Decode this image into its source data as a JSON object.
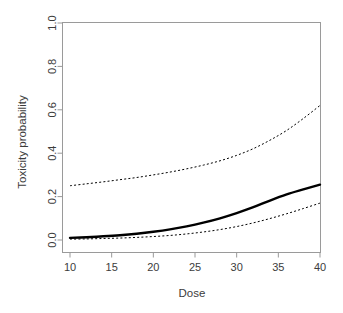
{
  "chart_data": {
    "type": "line",
    "title": "",
    "subtitle": "",
    "xlabel": "Dose",
    "ylabel": "Toxicity probability",
    "xlim": [
      10,
      40
    ],
    "ylim": [
      0.0,
      1.0
    ],
    "xticks": [
      10,
      15,
      20,
      25,
      30,
      35,
      40
    ],
    "xticklabels": [
      "10",
      "15",
      "20",
      "25",
      "30",
      "35",
      "40"
    ],
    "yticks": [
      0.0,
      0.2,
      0.4,
      0.6,
      0.8,
      1.0
    ],
    "yticklabels": [
      "0.0",
      "0.2",
      "0.4",
      "0.6",
      "0.8",
      "1.0"
    ],
    "grid": false,
    "legend": false,
    "legend_position": "none",
    "box": true,
    "x": [
      10,
      12,
      14,
      16,
      18,
      20,
      22,
      24,
      26,
      28,
      30,
      32,
      34,
      36,
      38,
      40
    ],
    "series": [
      {
        "name": "Posterior mean toxicity probability",
        "style": "solid",
        "color": "#000000",
        "width": 2.4,
        "values": [
          0.01,
          0.013,
          0.017,
          0.022,
          0.029,
          0.038,
          0.049,
          0.063,
          0.08,
          0.1,
          0.124,
          0.151,
          0.182,
          0.21,
          0.233,
          0.255
        ]
      },
      {
        "name": "Upper credible limit",
        "style": "dotted",
        "color": "#000000",
        "width": 1.0,
        "values": [
          0.25,
          0.259,
          0.268,
          0.278,
          0.288,
          0.3,
          0.313,
          0.328,
          0.345,
          0.365,
          0.39,
          0.421,
          0.46,
          0.505,
          0.56,
          0.62
        ]
      },
      {
        "name": "Lower credible limit",
        "style": "dotted",
        "color": "#000000",
        "width": 1.0,
        "values": [
          0.004,
          0.005,
          0.007,
          0.009,
          0.012,
          0.016,
          0.021,
          0.028,
          0.037,
          0.048,
          0.062,
          0.079,
          0.099,
          0.121,
          0.145,
          0.17
        ]
      }
    ]
  },
  "axes": {
    "x_title": "Dose",
    "y_title": "Toxicity probability",
    "x_ticks": [
      {
        "label": "10",
        "value": 10
      },
      {
        "label": "15",
        "value": 15
      },
      {
        "label": "20",
        "value": 20
      },
      {
        "label": "25",
        "value": 25
      },
      {
        "label": "30",
        "value": 30
      },
      {
        "label": "35",
        "value": 35
      },
      {
        "label": "40",
        "value": 40
      }
    ],
    "y_ticks": [
      {
        "label": "0.0",
        "value": 0.0
      },
      {
        "label": "0.2",
        "value": 0.2
      },
      {
        "label": "0.4",
        "value": 0.4
      },
      {
        "label": "0.6",
        "value": 0.6
      },
      {
        "label": "0.8",
        "value": 0.8
      },
      {
        "label": "1.0",
        "value": 1.0
      }
    ]
  },
  "colors": {
    "background": "#ffffff",
    "axis": "#999999",
    "text": "#3c3c3c",
    "curve": "#000000"
  }
}
